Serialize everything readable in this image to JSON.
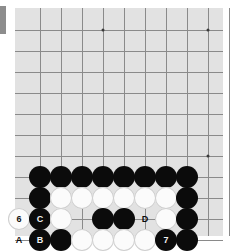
{
  "figure": {
    "kind": "go-board-diagram",
    "board": {
      "background_color": "#e2e2e2",
      "line_color": "#8a8a8a",
      "columns": 10,
      "rows": 11,
      "cell_size": 21,
      "origin_x": 25,
      "origin_y": 22,
      "star_points": [
        {
          "col": 3,
          "row": 0
        },
        {
          "col": 8,
          "row": 0
        },
        {
          "col": 8,
          "row": 6
        }
      ]
    },
    "colors": {
      "black_stone": "#0b0b0b",
      "white_stone": "#fbfbfb",
      "black_label_text": "#f2f2f2",
      "white_label_text": "#121212",
      "board": "#e2e2e2",
      "grid": "#8a8a8a",
      "page": "#ffffff",
      "edge_marker": "#8d8d8d"
    },
    "stones": [
      {
        "col": 0,
        "row": 7,
        "color": "black",
        "label": ""
      },
      {
        "col": 1,
        "row": 7,
        "color": "black",
        "label": ""
      },
      {
        "col": 2,
        "row": 7,
        "color": "black",
        "label": ""
      },
      {
        "col": 3,
        "row": 7,
        "color": "black",
        "label": ""
      },
      {
        "col": 4,
        "row": 7,
        "color": "black",
        "label": ""
      },
      {
        "col": 5,
        "row": 7,
        "color": "black",
        "label": ""
      },
      {
        "col": 6,
        "row": 7,
        "color": "black",
        "label": ""
      },
      {
        "col": 7,
        "row": 7,
        "color": "black",
        "label": ""
      },
      {
        "col": 0,
        "row": 8,
        "color": "black",
        "label": ""
      },
      {
        "col": 1,
        "row": 8,
        "color": "white",
        "label": ""
      },
      {
        "col": 2,
        "row": 8,
        "color": "white",
        "label": ""
      },
      {
        "col": 3,
        "row": 8,
        "color": "white",
        "label": ""
      },
      {
        "col": 4,
        "row": 8,
        "color": "white",
        "label": ""
      },
      {
        "col": 5,
        "row": 8,
        "color": "white",
        "label": ""
      },
      {
        "col": 6,
        "row": 8,
        "color": "white",
        "label": ""
      },
      {
        "col": 7,
        "row": 8,
        "color": "black",
        "label": ""
      },
      {
        "col": -1,
        "row": 9,
        "color": "white",
        "label": "6"
      },
      {
        "col": 0,
        "row": 9,
        "color": "black",
        "label": "C"
      },
      {
        "col": 1,
        "row": 9,
        "color": "white",
        "label": ""
      },
      {
        "col": 3,
        "row": 9,
        "color": "black",
        "label": ""
      },
      {
        "col": 4,
        "row": 9,
        "color": "black",
        "label": ""
      },
      {
        "col": 6,
        "row": 9,
        "color": "white",
        "label": ""
      },
      {
        "col": 7,
        "row": 9,
        "color": "black",
        "label": ""
      },
      {
        "col": 0,
        "row": 10,
        "color": "black",
        "label": "B"
      },
      {
        "col": 1,
        "row": 10,
        "color": "black",
        "label": ""
      },
      {
        "col": 2,
        "row": 10,
        "color": "white",
        "label": ""
      },
      {
        "col": 3,
        "row": 10,
        "color": "white",
        "label": ""
      },
      {
        "col": 4,
        "row": 10,
        "color": "white",
        "label": ""
      },
      {
        "col": 5,
        "row": 10,
        "color": "white",
        "label": ""
      },
      {
        "col": 6,
        "row": 10,
        "color": "black",
        "label": "7"
      },
      {
        "col": 7,
        "row": 10,
        "color": "black",
        "label": ""
      }
    ],
    "point_labels": [
      {
        "col": -1,
        "row": 10,
        "text": "A"
      },
      {
        "col": 5,
        "row": 9,
        "text": "D"
      }
    ]
  }
}
